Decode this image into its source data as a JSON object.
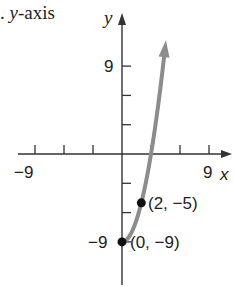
{
  "caption": {
    "prefix": ".",
    "var": "y",
    "suffix": "-axis"
  },
  "chart_data": {
    "type": "line",
    "title": "",
    "function": "y = x^2 - 9, x >= 0",
    "xlabel": "x",
    "ylabel": "y",
    "xlim": [
      -9,
      9
    ],
    "ylim": [
      -9,
      9
    ],
    "x_ticks": [
      -9,
      -6,
      -3,
      3,
      6,
      9
    ],
    "y_ticks": [
      -9,
      -6,
      -3,
      3,
      6,
      9
    ],
    "x_tick_labels": [
      "-9",
      "9"
    ],
    "y_tick_labels": [
      "9",
      "-9"
    ],
    "grid": false,
    "series": [
      {
        "name": "curve",
        "color": "#8c8c8c",
        "x": [
          0,
          0.5,
          1,
          1.5,
          2,
          2.5,
          3,
          3.5,
          4,
          4.5
        ],
        "y": [
          -9,
          -8.75,
          -8,
          -6.75,
          -5,
          -2.75,
          0,
          3.25,
          7,
          11.25
        ],
        "arrow_end": true
      }
    ],
    "points": [
      {
        "x": 2,
        "y": -5,
        "label": "(2, −5)"
      },
      {
        "x": 0,
        "y": -9,
        "label": "(0, −9)"
      }
    ]
  },
  "labels": {
    "x_axis": "x",
    "y_axis": "y",
    "x_min": "−9",
    "x_max": "9",
    "y_max": "9",
    "y_min": "−9",
    "point1": "(2, −5)",
    "point2": "(0, −9)"
  },
  "colors": {
    "axis": "#333333",
    "curve": "#8c8c8c",
    "point": "#111111"
  }
}
